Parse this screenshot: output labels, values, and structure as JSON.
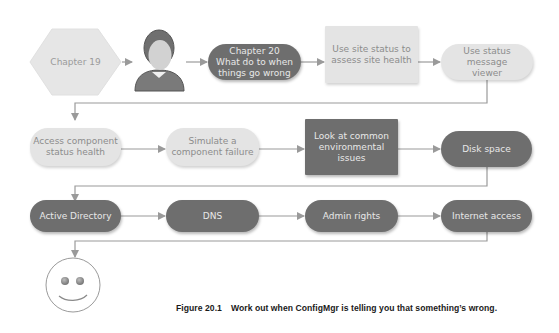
{
  "diagram": {
    "colors": {
      "light_fill": "#e4e4e4",
      "light_text": "#8c8c8c",
      "dark_fill": "#6e6e6e",
      "dark_text": "#e8e8e8",
      "connector": "#9a9a9a"
    },
    "row1": [
      {
        "id": "chapter19",
        "shape": "hexagon",
        "style": "light",
        "label": "Chapter 19"
      },
      {
        "id": "person",
        "shape": "person-icon",
        "label": ""
      },
      {
        "id": "chapter20",
        "shape": "pill",
        "style": "dark",
        "label": "Chapter 20 What do to when things go wrong",
        "lines": [
          "Chapter 20",
          "What do to when",
          "things go wrong"
        ]
      },
      {
        "id": "site-status",
        "shape": "rect",
        "style": "light",
        "label": "Use site status to assess site health",
        "lines": [
          "Use site status to",
          "assess site health"
        ]
      },
      {
        "id": "status-message-viewer",
        "shape": "pill",
        "style": "light",
        "label": "Use status message viewer",
        "lines": [
          "Use status message",
          "viewer"
        ]
      }
    ],
    "row2": [
      {
        "id": "component-status",
        "shape": "pill",
        "style": "light",
        "label": "Access component status health",
        "lines": [
          "Access component",
          "status health"
        ]
      },
      {
        "id": "simulate-failure",
        "shape": "pill",
        "style": "light",
        "label": "Simulate a component failure",
        "lines": [
          "Simulate a",
          "component failure"
        ]
      },
      {
        "id": "environmental-issues",
        "shape": "rect",
        "style": "dark",
        "label": "Look at common environmental issues",
        "lines": [
          "Look at common",
          "environmental",
          "issues"
        ]
      },
      {
        "id": "disk-space",
        "shape": "pill",
        "style": "dark",
        "label": "Disk space"
      }
    ],
    "row3": [
      {
        "id": "active-directory",
        "shape": "pill",
        "style": "dark",
        "label": "Active Directory"
      },
      {
        "id": "dns",
        "shape": "pill",
        "style": "dark",
        "label": "DNS"
      },
      {
        "id": "admin-rights",
        "shape": "pill",
        "style": "dark",
        "label": "Admin rights"
      },
      {
        "id": "internet-access",
        "shape": "pill",
        "style": "dark",
        "label": "Internet access"
      }
    ],
    "end": {
      "id": "smiley",
      "shape": "smiley-face-icon",
      "label": ""
    },
    "edges": [
      [
        "chapter19",
        "person"
      ],
      [
        "person",
        "chapter20"
      ],
      [
        "chapter20",
        "site-status"
      ],
      [
        "site-status",
        "status-message-viewer"
      ],
      [
        "status-message-viewer",
        "component-status"
      ],
      [
        "component-status",
        "simulate-failure"
      ],
      [
        "simulate-failure",
        "environmental-issues"
      ],
      [
        "environmental-issues",
        "disk-space"
      ],
      [
        "disk-space",
        "active-directory"
      ],
      [
        "active-directory",
        "dns"
      ],
      [
        "dns",
        "admin-rights"
      ],
      [
        "admin-rights",
        "internet-access"
      ],
      [
        "internet-access",
        "smiley"
      ]
    ]
  },
  "caption": {
    "figure_number": "Figure 20.1",
    "text": "Work out when ConfigMgr is telling you that something’s wrong."
  }
}
